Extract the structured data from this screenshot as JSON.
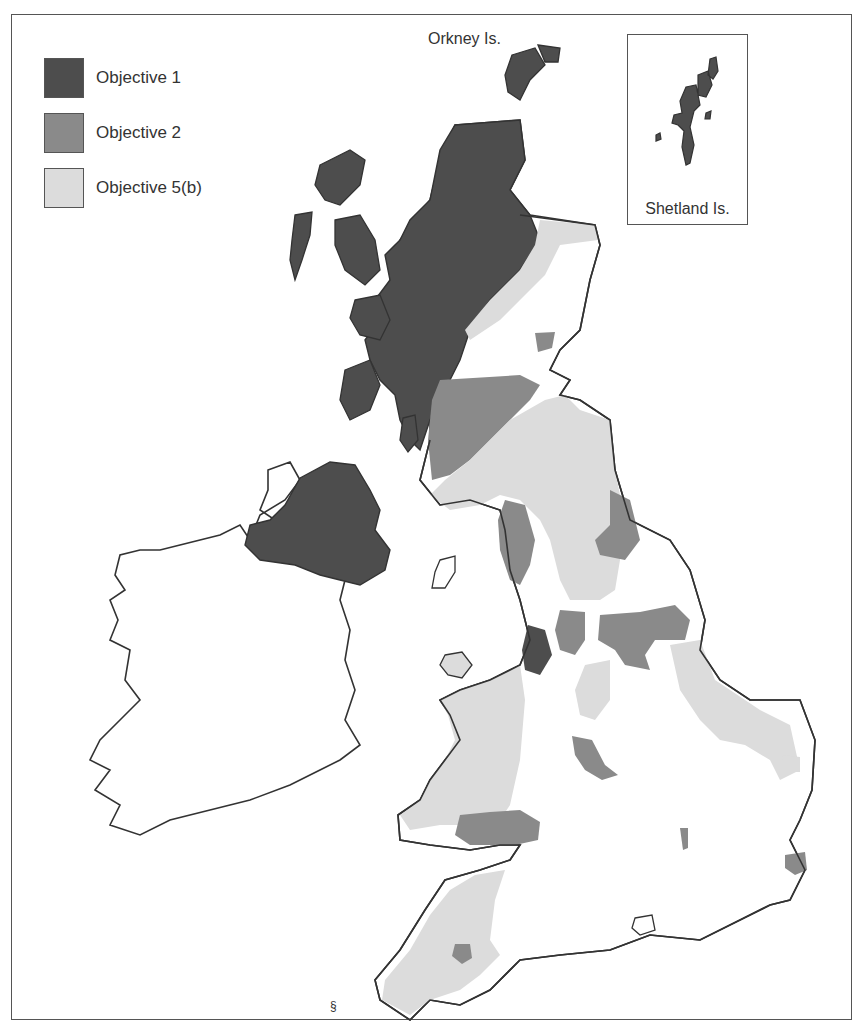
{
  "legend": {
    "items": [
      {
        "label": "Objective 1",
        "color": "#4d4d4d"
      },
      {
        "label": "Objective 2",
        "color": "#8a8a8a"
      },
      {
        "label": "Objective 5(b)",
        "color": "#dcdcdc"
      }
    ]
  },
  "labels": {
    "orkney": "Orkney Is.",
    "shetland": "Shetland Is."
  },
  "colors": {
    "objective_1": "#4d4d4d",
    "objective_2": "#8a8a8a",
    "objective_5b": "#dcdcdc",
    "coastline": "#333333",
    "land_unclassified": "#ffffff"
  }
}
